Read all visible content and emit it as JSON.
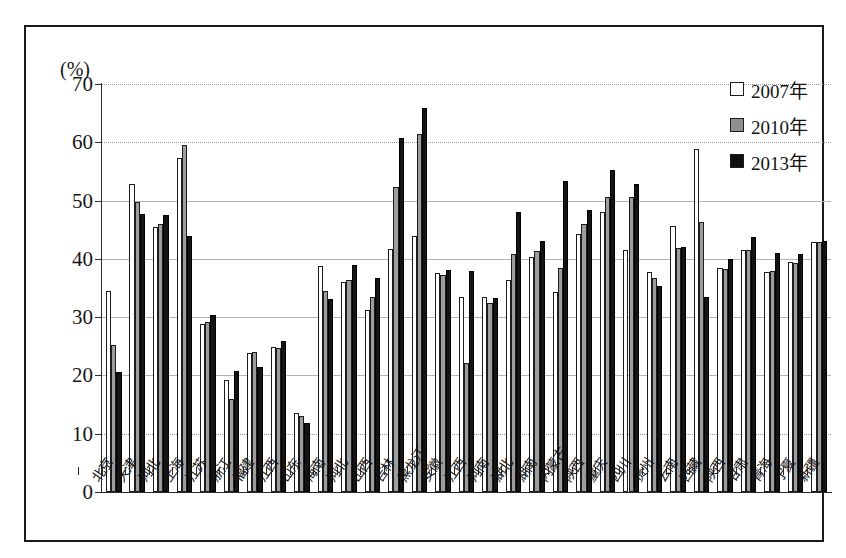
{
  "chart_data": {
    "type": "bar",
    "title": "",
    "subtitle": "",
    "xlabel": "",
    "ylabel": "(%)",
    "ylim": [
      0,
      70
    ],
    "yticks": [
      0,
      10,
      20,
      30,
      40,
      50,
      60,
      70
    ],
    "grid": true,
    "legend_position": "top-right",
    "categories": [
      "北京",
      "天津",
      "河北",
      "上海",
      "江苏",
      "浙江",
      "福建",
      "江西",
      "山东",
      "海南",
      "河北",
      "山西",
      "吉林",
      "黑龙江",
      "安徽",
      "江西",
      "河南",
      "湖北",
      "湖南",
      "内蒙古",
      "陕西",
      "重庆",
      "四川",
      "贵州",
      "云南",
      "西藏",
      "陕西",
      "甘肃",
      "青海",
      "宁夏",
      "新疆"
    ],
    "series": [
      {
        "name": "2007年",
        "color": "#ffffff",
        "values": [
          34.5,
          52.9,
          45.5,
          57.3,
          28.8,
          19.3,
          23.9,
          24.8,
          13.6,
          38.8,
          36.0,
          31.2,
          41.7,
          44.0,
          37.5,
          33.4,
          33.4,
          36.4,
          40.4,
          34.4,
          44.3,
          48.0,
          41.6,
          37.8,
          45.6,
          58.8,
          38.4,
          41.6,
          37.8,
          39.5,
          42.9
        ]
      },
      {
        "name": "2010年",
        "color": "#9d9d9d",
        "values": [
          25.3,
          49.7,
          46.0,
          59.5,
          29.2,
          16.0,
          24.1,
          24.7,
          13.1,
          34.5,
          36.4,
          33.4,
          52.4,
          61.4,
          37.3,
          22.1,
          32.5,
          40.8,
          41.3,
          38.4,
          46.0,
          50.6,
          50.6,
          36.8,
          41.8,
          46.3,
          38.2,
          41.6,
          37.9,
          39.3,
          42.9
        ]
      },
      {
        "name": "2013年",
        "color": "#141414",
        "values": [
          20.6,
          47.7,
          47.5,
          44.0,
          30.4,
          20.7,
          21.4,
          25.9,
          11.9,
          33.1,
          39.0,
          36.7,
          60.7,
          65.8,
          38.1,
          38.0,
          33.3,
          48.0,
          43.0,
          53.3,
          48.3,
          55.2,
          52.9,
          35.4,
          42.0,
          33.5,
          40.0,
          43.8,
          41.0,
          40.8,
          43.1
        ]
      }
    ]
  },
  "axis": {
    "unit_label": "(%)",
    "tick_labels": [
      "0",
      "10",
      "20",
      "30",
      "40",
      "50",
      "60",
      "70"
    ]
  },
  "legend": {
    "items": [
      {
        "label": "2007年",
        "key": "y2007"
      },
      {
        "label": "2010年",
        "key": "y2010"
      },
      {
        "label": "2013年",
        "key": "y2013"
      }
    ]
  }
}
